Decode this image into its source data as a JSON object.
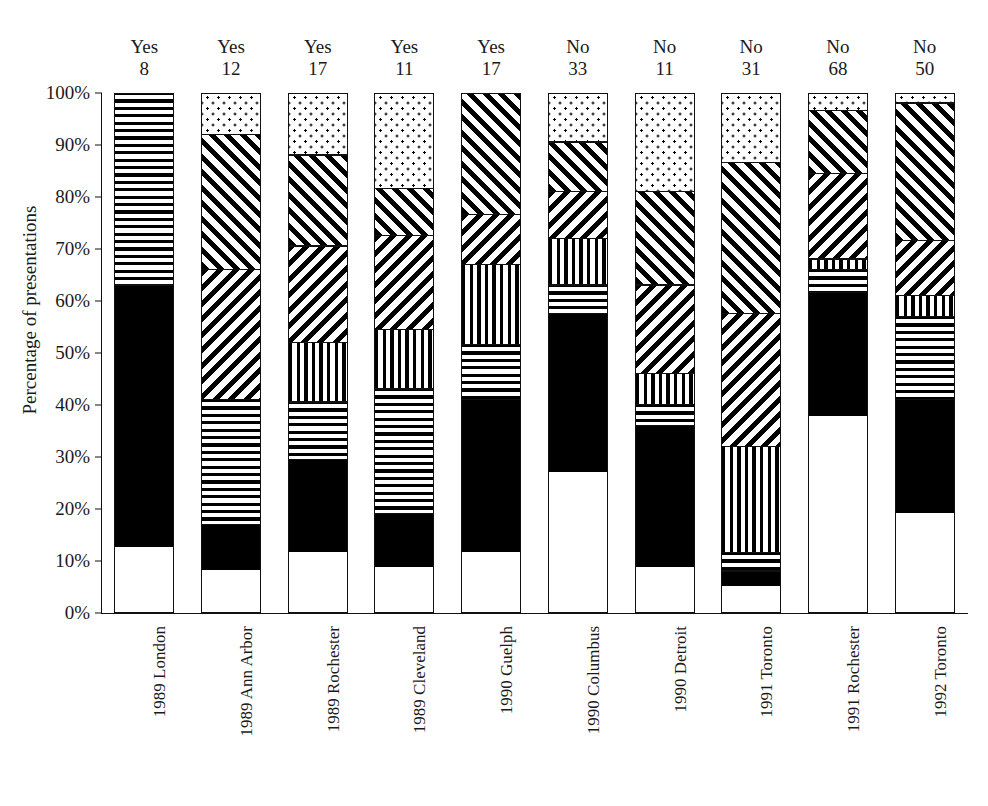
{
  "axes": {
    "ylabel": "Percentage of presentations",
    "yticks": [
      "100%",
      "90%",
      "80%",
      "70%",
      "60%",
      "50%",
      "40%",
      "30%",
      "20%",
      "10%",
      "0%"
    ],
    "ytick_values": [
      100,
      90,
      80,
      70,
      60,
      50,
      40,
      30,
      20,
      10,
      0
    ],
    "ylim": [
      0,
      100
    ]
  },
  "chart_data": {
    "type": "bar",
    "title": "",
    "xlabel": "",
    "ylabel": "Percentage of presentations",
    "ylim": [
      0,
      100
    ],
    "grid": false,
    "legend": "none",
    "stacked": true,
    "normalized_percent": true,
    "categories": [
      "1989 London",
      "1989 Ann Arbor",
      "1989 Rochester",
      "1989 Cleveland",
      "1990 Guelph",
      "1990 Columbus",
      "1990 Detroit",
      "1991 Toronto",
      "1991 Rochester",
      "1992 Toronto"
    ],
    "annotations": {
      "top_row_1": [
        "Yes",
        "Yes",
        "Yes",
        "Yes",
        "Yes",
        "No",
        "No",
        "No",
        "No",
        "No"
      ],
      "top_row_2": [
        "8",
        "12",
        "17",
        "11",
        "17",
        "33",
        "11",
        "31",
        "68",
        "50"
      ]
    },
    "series": [
      {
        "name": "white",
        "pattern": "solid-white",
        "values": [
          12.5,
          8.0,
          11.5,
          8.7,
          11.5,
          27.0,
          8.7,
          5.0,
          37.7,
          19.0
        ]
      },
      {
        "name": "black",
        "pattern": "solid-black",
        "values": [
          50.5,
          9.0,
          18.0,
          10.3,
          29.5,
          30.5,
          27.3,
          3.0,
          23.8,
          22.0
        ]
      },
      {
        "name": "horizontal",
        "pattern": "horizontal-lines",
        "values": [
          37.0,
          24.0,
          11.0,
          24.0,
          10.5,
          5.5,
          4.0,
          3.5,
          4.5,
          16.0
        ]
      },
      {
        "name": "vertical",
        "pattern": "vertical-lines",
        "values": [
          0.0,
          0.0,
          11.5,
          11.5,
          15.5,
          9.0,
          6.0,
          20.5,
          2.0,
          4.0
        ]
      },
      {
        "name": "diagonal-back",
        "pattern": "diagonal-backslash",
        "values": [
          0.0,
          25.0,
          18.5,
          18.0,
          9.5,
          9.0,
          17.0,
          25.5,
          16.5,
          10.5
        ]
      },
      {
        "name": "diagonal-fwd",
        "pattern": "diagonal-slash",
        "values": [
          0.0,
          26.0,
          17.5,
          9.0,
          23.5,
          9.5,
          18.0,
          29.0,
          12.0,
          26.5
        ]
      },
      {
        "name": "dotted",
        "pattern": "dot-stipple",
        "values": [
          0.0,
          8.0,
          12.0,
          18.5,
          0.0,
          9.5,
          19.0,
          13.5,
          3.5,
          2.0
        ]
      }
    ],
    "stack_boundaries_percent": [
      [
        0,
        12.5,
        63.0,
        100.0,
        100.0,
        100.0,
        100.0,
        100.0
      ],
      [
        0,
        8.0,
        17.0,
        41.0,
        41.0,
        66.0,
        92.0,
        100.0
      ],
      [
        0,
        11.5,
        29.5,
        40.5,
        52.0,
        70.5,
        88.0,
        100.0
      ],
      [
        0,
        8.7,
        19.0,
        43.0,
        54.5,
        72.5,
        81.5,
        100.0
      ],
      [
        0,
        11.5,
        41.0,
        51.5,
        67.0,
        76.5,
        100.0,
        100.0
      ],
      [
        0,
        27.0,
        57.5,
        63.0,
        72.0,
        81.0,
        90.5,
        100.0
      ],
      [
        0,
        8.7,
        36.0,
        40.0,
        46.0,
        63.0,
        81.0,
        100.0
      ],
      [
        0,
        5.0,
        8.0,
        11.5,
        32.0,
        57.5,
        86.5,
        100.0
      ],
      [
        0,
        37.7,
        61.5,
        66.0,
        68.0,
        84.5,
        96.5,
        100.0
      ],
      [
        0,
        19.0,
        41.0,
        57.0,
        61.0,
        71.5,
        98.0,
        100.0
      ]
    ]
  }
}
